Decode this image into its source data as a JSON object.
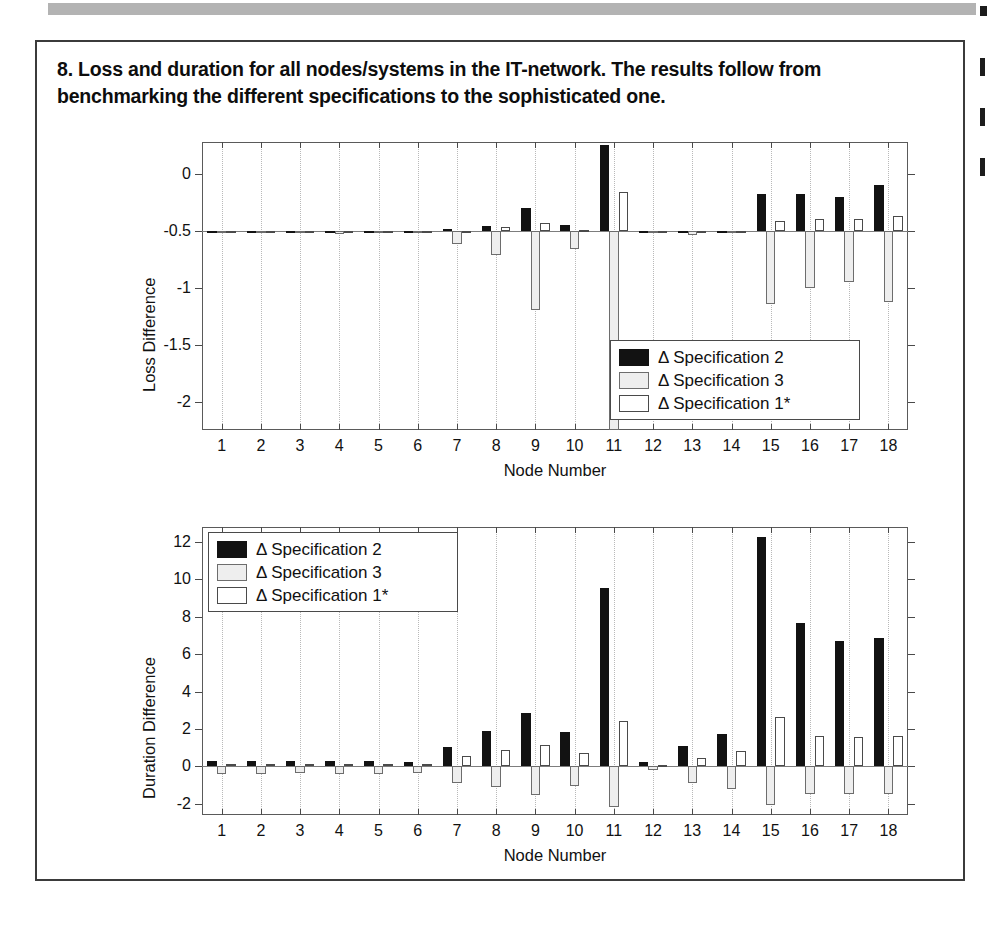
{
  "page": {
    "top_rule_color": "#b3b3b3",
    "frame_color": "#3b3b3b"
  },
  "figure": {
    "caption": "8. Loss and duration for all nodes/systems in the IT-network. The results follow from benchmarking the different specifications to the sophisticated one."
  },
  "series_style": {
    "spec2_color": "#121212",
    "spec3_color": "#eeeeee",
    "spec1_color": "#ffffff"
  },
  "legend": {
    "items": [
      {
        "label": "Δ Specification 2",
        "key": "s2"
      },
      {
        "label": "Δ Specification 3",
        "key": "s3"
      },
      {
        "label": "Δ Specification 1*",
        "key": "s1"
      }
    ]
  },
  "chart_data": [
    {
      "id": "loss",
      "type": "bar",
      "title": "",
      "xlabel": "Node Number",
      "ylabel": "Loss Difference",
      "categories": [
        "1",
        "2",
        "3",
        "4",
        "5",
        "6",
        "7",
        "8",
        "9",
        "10",
        "11",
        "12",
        "13",
        "14",
        "15",
        "16",
        "17",
        "18"
      ],
      "x": [
        1,
        2,
        3,
        4,
        5,
        6,
        7,
        8,
        9,
        10,
        11,
        12,
        13,
        14,
        15,
        16,
        17,
        18
      ],
      "ylim": [
        -2.25,
        0.28
      ],
      "yticks": [
        0,
        -0.5,
        -1,
        -1.5,
        -2
      ],
      "yticklabels": [
        "0",
        "-0.5",
        "-1",
        "-1.5",
        "-2"
      ],
      "baseline": -0.5,
      "grid": "vertical-dotted",
      "legend_position": "bottom-right",
      "series": [
        {
          "name": "Δ Specification 2",
          "key": "s2",
          "values": [
            -0.5,
            -0.5,
            -0.5,
            -0.5,
            -0.5,
            -0.5,
            -0.48,
            -0.46,
            -0.3,
            -0.45,
            0.25,
            -0.5,
            -0.5,
            -0.5,
            -0.18,
            -0.18,
            -0.2,
            -0.1
          ]
        },
        {
          "name": "Δ Specification 3",
          "key": "s3",
          "values": [
            -0.52,
            -0.52,
            -0.52,
            -0.53,
            -0.52,
            -0.51,
            -0.62,
            -0.71,
            -1.2,
            -0.66,
            -2.25,
            -0.5,
            -0.54,
            -0.5,
            -1.14,
            -1.0,
            -0.95,
            -1.13
          ]
        },
        {
          "name": "Δ Specification 1*",
          "key": "s1",
          "values": [
            -0.5,
            -0.5,
            -0.5,
            -0.5,
            -0.5,
            -0.5,
            -0.5,
            -0.47,
            -0.43,
            -0.49,
            -0.16,
            -0.5,
            -0.5,
            -0.5,
            -0.41,
            -0.4,
            -0.4,
            -0.37
          ]
        }
      ]
    },
    {
      "id": "duration",
      "type": "bar",
      "title": "",
      "xlabel": "Node Number",
      "ylabel": "Duration Difference",
      "categories": [
        "1",
        "2",
        "3",
        "4",
        "5",
        "6",
        "7",
        "8",
        "9",
        "10",
        "11",
        "12",
        "13",
        "14",
        "15",
        "16",
        "17",
        "18"
      ],
      "x": [
        1,
        2,
        3,
        4,
        5,
        6,
        7,
        8,
        9,
        10,
        11,
        12,
        13,
        14,
        15,
        16,
        17,
        18
      ],
      "ylim": [
        -2.6,
        12.8
      ],
      "yticks": [
        12,
        10,
        8,
        6,
        4,
        2,
        0,
        -2
      ],
      "yticklabels": [
        "12",
        "10",
        "8",
        "6",
        "4",
        "2",
        "0",
        "-2"
      ],
      "baseline": 0,
      "grid": "vertical-dotted",
      "legend_position": "top-left",
      "series": [
        {
          "name": "Δ Specification 2",
          "key": "s2",
          "values": [
            0.3,
            0.3,
            0.28,
            0.3,
            0.3,
            0.26,
            1.05,
            1.9,
            2.85,
            1.85,
            9.55,
            0.25,
            1.1,
            1.75,
            12.25,
            7.65,
            6.7,
            6.85
          ]
        },
        {
          "name": "Δ Specification 3",
          "key": "s3",
          "values": [
            -0.4,
            -0.4,
            -0.38,
            -0.4,
            -0.4,
            -0.36,
            -0.9,
            -1.1,
            -1.55,
            -1.05,
            -2.15,
            -0.2,
            -0.9,
            -1.2,
            -2.05,
            -1.5,
            -1.5,
            -1.5
          ]
        },
        {
          "name": "Δ Specification 1*",
          "key": "s1",
          "values": [
            0.12,
            0.12,
            0.12,
            0.12,
            0.12,
            0.12,
            0.55,
            0.85,
            1.15,
            0.7,
            2.45,
            0.05,
            0.45,
            0.8,
            2.65,
            1.6,
            1.55,
            1.6
          ]
        }
      ]
    }
  ]
}
